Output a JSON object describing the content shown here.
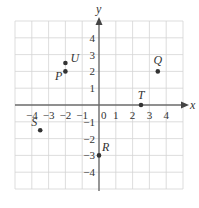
{
  "diagram": {
    "type": "coordinate-plane",
    "axes": {
      "x_label": "x",
      "y_label": "y",
      "x_range": [
        -5,
        5
      ],
      "y_range": [
        -5,
        5
      ],
      "origin_label": "0",
      "x_ticks": [
        {
          "value": -4,
          "label": "−4"
        },
        {
          "value": -3,
          "label": "−3"
        },
        {
          "value": -2,
          "label": "−2"
        },
        {
          "value": -1,
          "label": "−1"
        },
        {
          "value": 1,
          "label": "1"
        },
        {
          "value": 2,
          "label": "2"
        },
        {
          "value": 3,
          "label": "3"
        },
        {
          "value": 4,
          "label": "4"
        }
      ],
      "y_ticks": [
        {
          "value": 4,
          "label": "4"
        },
        {
          "value": 3,
          "label": "3"
        },
        {
          "value": 2,
          "label": "2"
        },
        {
          "value": 1,
          "label": "1"
        },
        {
          "value": -1,
          "label": "−1"
        },
        {
          "value": -2,
          "label": "−2"
        },
        {
          "value": -3,
          "label": "−3"
        },
        {
          "value": -4,
          "label": "−4"
        }
      ]
    },
    "points": [
      {
        "name": "U",
        "x": -2,
        "y": 2.5
      },
      {
        "name": "P",
        "x": -2,
        "y": 2
      },
      {
        "name": "Q",
        "x": 3.5,
        "y": 2
      },
      {
        "name": "T",
        "x": 2.5,
        "y": 0
      },
      {
        "name": "S",
        "x": -3.5,
        "y": -1.5
      },
      {
        "name": "R",
        "x": 0,
        "y": -3
      }
    ],
    "colors": {
      "grid": "#d4d4d4",
      "axis": "#6a6a6a",
      "point": "#333333"
    }
  }
}
